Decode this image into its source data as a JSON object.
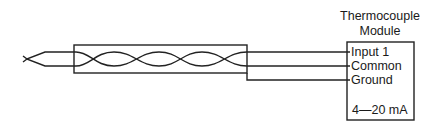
{
  "diagram": {
    "type": "wiring",
    "module": {
      "title_line1": "Thermocouple",
      "title_line2": "Module",
      "terminals": [
        "Input 1",
        "Common",
        "Ground"
      ],
      "output": "4—20 mA"
    },
    "cable": {
      "shield": true,
      "twisted_pair": true
    },
    "colors": {
      "stroke": "#222222",
      "background": "#ffffff"
    }
  }
}
